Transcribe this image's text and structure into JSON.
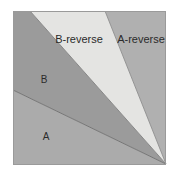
{
  "figure": {
    "background_color": "#ffffff",
    "border_color": "#9a9a9a",
    "outline_color": "#6e6e6e",
    "frame": {
      "x": 13,
      "y": 11,
      "width": 153,
      "height": 154
    },
    "apex": {
      "x": 166,
      "y": 164
    }
  },
  "labels": {
    "b_reverse": "B-reverse",
    "a_reverse": "A-reverse",
    "b": "B",
    "a": "A"
  },
  "regions": [
    {
      "id": "region-b",
      "label": "B",
      "fill": "#9b9b9b",
      "description": "dark gray wedge upper-left",
      "points": "13,11 30,11 166,164 13,90"
    },
    {
      "id": "region-b-reverse",
      "label": "B-reverse",
      "fill": "#e4e4e2",
      "description": "very light wedge top-center",
      "points": "30,11 105,11 166,164"
    },
    {
      "id": "region-a-reverse",
      "label": "A-reverse",
      "fill": "#b0b0b0",
      "description": "medium gray wedge top-right",
      "points": "105,11 166,11 166,164"
    },
    {
      "id": "region-a",
      "label": "A",
      "fill": "#ababab",
      "description": "medium gray wedge bottom-left",
      "points": "13,90 166,164 13,165"
    }
  ]
}
